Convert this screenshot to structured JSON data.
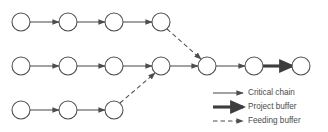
{
  "figure": {
    "type": "network-diagram",
    "background_color": "#ffffff",
    "stroke_color": "#4d4d4d",
    "text_color": "#4a4a4a",
    "node_radius": 9,
    "node_fill": "#ffffff"
  },
  "chains": [
    {
      "id": "top-chain",
      "row_y": 22,
      "nodes": [
        {
          "id": "t1",
          "cx": 21,
          "cy": 22
        },
        {
          "id": "t2",
          "cx": 68,
          "cy": 22
        },
        {
          "id": "t3",
          "cx": 114,
          "cy": 22
        },
        {
          "id": "t4",
          "cx": 161,
          "cy": 22
        }
      ]
    },
    {
      "id": "middle-chain",
      "row_y": 66,
      "nodes": [
        {
          "id": "m1",
          "cx": 21,
          "cy": 66
        },
        {
          "id": "m2",
          "cx": 68,
          "cy": 66
        },
        {
          "id": "m3",
          "cx": 114,
          "cy": 66
        },
        {
          "id": "m4",
          "cx": 161,
          "cy": 66
        },
        {
          "id": "m5",
          "cx": 207,
          "cy": 66
        },
        {
          "id": "m6",
          "cx": 254,
          "cy": 66
        },
        {
          "id": "m7",
          "cx": 301,
          "cy": 66
        }
      ]
    },
    {
      "id": "bottom-chain",
      "row_y": 110,
      "nodes": [
        {
          "id": "b1",
          "cx": 21,
          "cy": 110
        },
        {
          "id": "b2",
          "cx": 68,
          "cy": 110
        },
        {
          "id": "b3",
          "cx": 114,
          "cy": 110
        }
      ]
    }
  ],
  "links": [
    {
      "id": "t1-t2",
      "kind": "critical-chain",
      "x1": 30,
      "y1": 22,
      "x2": 59,
      "y2": 22
    },
    {
      "id": "t2-t3",
      "kind": "critical-chain",
      "x1": 77,
      "y1": 22,
      "x2": 105,
      "y2": 22
    },
    {
      "id": "t3-t4",
      "kind": "critical-chain",
      "x1": 123,
      "y1": 22,
      "x2": 152,
      "y2": 22
    },
    {
      "id": "m1-m2",
      "kind": "critical-chain",
      "x1": 30,
      "y1": 66,
      "x2": 59,
      "y2": 66
    },
    {
      "id": "m2-m3",
      "kind": "critical-chain",
      "x1": 77,
      "y1": 66,
      "x2": 105,
      "y2": 66
    },
    {
      "id": "m3-m4",
      "kind": "critical-chain",
      "x1": 123,
      "y1": 66,
      "x2": 152,
      "y2": 66
    },
    {
      "id": "m4-m5",
      "kind": "critical-chain",
      "x1": 170,
      "y1": 66,
      "x2": 198,
      "y2": 66
    },
    {
      "id": "m5-m6",
      "kind": "critical-chain",
      "x1": 216,
      "y1": 66,
      "x2": 245,
      "y2": 66
    },
    {
      "id": "m6-m7",
      "kind": "project-buffer",
      "x1": 263,
      "y1": 66,
      "x2": 292,
      "y2": 66
    },
    {
      "id": "b1-b2",
      "kind": "critical-chain",
      "x1": 30,
      "y1": 110,
      "x2": 59,
      "y2": 110
    },
    {
      "id": "b2-b3",
      "kind": "critical-chain",
      "x1": 77,
      "y1": 110,
      "x2": 105,
      "y2": 110
    },
    {
      "id": "t4-m5",
      "kind": "feeding-buffer",
      "x1": 167,
      "y1": 29,
      "x2": 201,
      "y2": 59
    },
    {
      "id": "b3-m4",
      "kind": "feeding-buffer",
      "x1": 120,
      "y1": 103,
      "x2": 155,
      "y2": 73
    }
  ],
  "legend": {
    "items": [
      {
        "id": "legend-critical-chain",
        "label": "Critical chain",
        "kind": "critical-chain",
        "line_x1": 213,
        "line_x2": 243,
        "line_y": 93,
        "text_x": 248,
        "text_y": 93
      },
      {
        "id": "legend-project-buffer",
        "label": "Project buffer",
        "kind": "project-buffer",
        "line_x1": 213,
        "line_x2": 243,
        "line_y": 107,
        "text_x": 248,
        "text_y": 107
      },
      {
        "id": "legend-feeding-buffer",
        "label": "Feeding buffer",
        "kind": "feeding-buffer",
        "line_x1": 213,
        "line_x2": 243,
        "line_y": 121,
        "text_x": 248,
        "text_y": 121
      }
    ]
  }
}
